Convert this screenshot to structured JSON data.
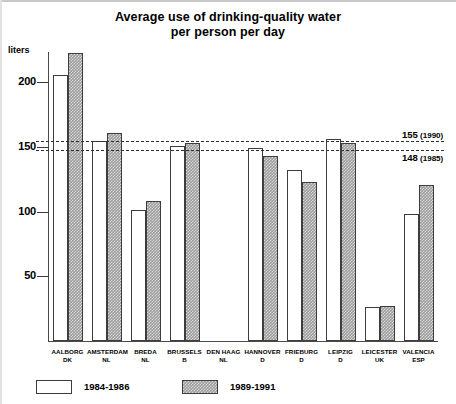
{
  "chart_data": {
    "type": "bar",
    "title": "Average use of drinking-quality water per person per day",
    "title_line1": "Average use of drinking-quality water",
    "title_line2": "per person per day",
    "xlabel": "",
    "ylabel": "liters",
    "ylim": [
      0,
      235
    ],
    "grid": false,
    "legend_position": "bottom-left",
    "yticks": [
      50,
      100,
      150,
      200
    ],
    "ytick_labels": [
      "50",
      "100",
      "150",
      "200"
    ],
    "categories": [
      "AALBORG DK",
      "AMSTERDAM NL",
      "BREDA NL",
      "BRUSSELS B",
      "DEN HAAG NL",
      "HANNOVER D",
      "FRIEBURG D",
      "LEIPZIG D",
      "LEICESTER UK",
      "VALENCIA ESP"
    ],
    "category_cities": [
      "AALBORG",
      "AMSTERDAM",
      "BREDA",
      "BRUSSELS",
      "DEN HAAG",
      "HANNOVER",
      "FRIEBURG",
      "LEIPZIG",
      "LEICESTER",
      "VALENCIA"
    ],
    "category_countries": [
      "DK",
      "NL",
      "NL",
      "B",
      "NL",
      "D",
      "D",
      "D",
      "UK",
      "ESP"
    ],
    "series": [
      {
        "name": "1984-1986",
        "color": "#ffffff",
        "values": [
          206,
          155,
          101,
          151,
          null,
          149,
          132,
          156,
          26,
          98
        ]
      },
      {
        "name": "1989-1991",
        "color": "#9d9d9d",
        "values": [
          223,
          161,
          108,
          153,
          null,
          143,
          123,
          153,
          27,
          121
        ]
      }
    ],
    "reference_lines": [
      {
        "value": 155,
        "label": "155",
        "year": "(1990)"
      },
      {
        "value": 148,
        "label": "148",
        "year": "(1985)"
      }
    ]
  },
  "legend": {
    "items": [
      {
        "label": "1984-1986"
      },
      {
        "label": "1989-1991"
      }
    ]
  }
}
